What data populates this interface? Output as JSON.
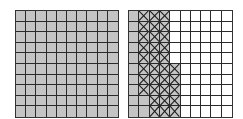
{
  "figure": {
    "colors": {
      "shaded": "#c4c4c4",
      "white": "#ffffff",
      "line": "#2a2a2a"
    },
    "left_grid": {
      "rows": 10,
      "cols": 10,
      "shaded_count": 100,
      "pattern": [
        "SSSSSSSSSS",
        "SSSSSSSSSS",
        "SSSSSSSSSS",
        "SSSSSSSSSS",
        "SSSSSSSSSS",
        "SSSSSSSSSS",
        "SSSSSSSSSS",
        "SSSSSSSSSS",
        "SSSSSSSSSS",
        "SSSSSSSSSS"
      ]
    },
    "right_grid": {
      "rows": 10,
      "cols": 10,
      "shaded_count": 12,
      "hatched_count": 33,
      "white_count": 55,
      "legend": {
        "S": "shaded",
        "X": "shaded-crosshatched",
        "W": "white"
      },
      "pattern": [
        "SXXXWWWWWW",
        "SXXXWWWWWW",
        "SXXXWWWWWW",
        "SXXXWWWWWW",
        "SXXXWWWWWW",
        "SXXXXWWWWW",
        "SXXXXWWWWW",
        "SXXXXWWWWW",
        "SSXXXWWWWW",
        "SSXXXWWWWW"
      ]
    }
  }
}
